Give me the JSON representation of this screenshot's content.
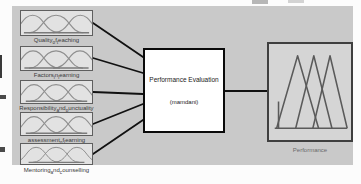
{
  "diagram": {
    "inputs": [
      {
        "label": "Quality_of_teaching"
      },
      {
        "label": "Factors_in_learning"
      },
      {
        "label": "Responsibility_and_punctuality"
      },
      {
        "label": "assessment_of_learning"
      },
      {
        "label": "Mentoring_and_counselling"
      }
    ],
    "system": {
      "title": "Performance Evaluation",
      "inference_type": "(mamdani)"
    },
    "output": {
      "label": "Performance"
    }
  },
  "icons": {
    "input_mf": "membership-curves-icon",
    "output_mf": "triangle-mf-icon"
  },
  "colors": {
    "canvas_bg": "#c9c9c9",
    "input_box_fill": "#e2e2e2",
    "system_box_fill": "#ffffff",
    "system_box_border": "#0a0a0a",
    "output_box_fill": "#d5d5d5",
    "wire": "#111111",
    "curve_stroke": "#8f8f8f"
  }
}
